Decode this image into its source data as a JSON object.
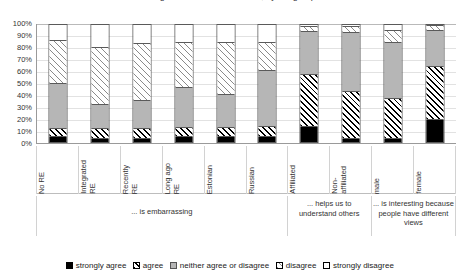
{
  "chart_data": {
    "type": "bar",
    "subtype": "stacked-percent",
    "title": "Religious education at school, by subgroup",
    "categories": [
      "No RE",
      "Integrated RE",
      "Recently RE",
      "Long ago RE",
      "Estonian",
      "Russian",
      "Affiliated",
      "Non-affiliated",
      "male",
      "female"
    ],
    "series": [
      {
        "name": "strongly agree",
        "key": "strongly-agree",
        "values": [
          4,
          3,
          3,
          4,
          4,
          4,
          13,
          3,
          3,
          19
        ]
      },
      {
        "name": "agree",
        "key": "agree",
        "values": [
          7,
          8,
          8,
          8,
          8,
          9,
          44,
          40,
          34,
          45
        ]
      },
      {
        "name": "neither agree or disagree",
        "key": "neither",
        "values": [
          39,
          21,
          24,
          34,
          28,
          48,
          37,
          50,
          48,
          31
        ]
      },
      {
        "name": "disagree",
        "key": "disagree",
        "values": [
          36,
          48,
          49,
          39,
          45,
          24,
          4,
          5,
          10,
          4
        ]
      },
      {
        "name": "strongly disagree",
        "key": "strongly-disagree",
        "values": [
          14,
          20,
          16,
          15,
          15,
          15,
          2,
          2,
          5,
          1
        ]
      }
    ],
    "ylabel": "",
    "xlabel": "",
    "ylim": [
      0,
      100
    ],
    "yticks": [
      "0%",
      "10%",
      "20%",
      "30%",
      "40%",
      "50%",
      "60%",
      "70%",
      "80%",
      "90%",
      "100%"
    ],
    "grid": true,
    "legend_position": "bottom",
    "group_labels": [
      {
        "label": "... is embarrassing",
        "span": 6
      },
      {
        "label": "... helps us to understand others",
        "span": 2
      },
      {
        "label": "... is interesting because people have different views",
        "span": 2
      }
    ],
    "colors": {
      "strongly_agree": "#000000",
      "agree": "#000000",
      "neither": "#b6b6b6",
      "disagree": "#8a8a8a",
      "strongly_disagree": "#ffffff",
      "axis": "#9a9a9a",
      "grid": "#e2e2e2"
    }
  },
  "legend": {
    "items": [
      {
        "label": "strongly agree",
        "key": "strongly-agree"
      },
      {
        "label": "agree",
        "key": "agree"
      },
      {
        "label": "neither agree or disagree",
        "key": "neither"
      },
      {
        "label": "disagree",
        "key": "disagree"
      },
      {
        "label": "strongly disagree",
        "key": "strongly-disagree"
      }
    ]
  }
}
